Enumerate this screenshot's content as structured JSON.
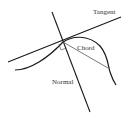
{
  "diagram": {
    "type": "tangent-normal-chord",
    "labels": {
      "tangent": "Tangent",
      "chord": "Chord",
      "normal": "Normal"
    },
    "colors": {
      "background": "#ffffff",
      "stroke": "#1a1a1a",
      "chord": "#555555",
      "text": "#333333"
    },
    "elements": [
      "curve",
      "tangent-line",
      "normal-line",
      "chord-line",
      "right-angle-marker"
    ]
  }
}
